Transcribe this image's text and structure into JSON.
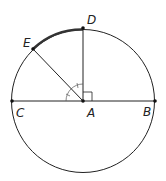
{
  "diagram": {
    "type": "circle-geometry",
    "center": {
      "label": "A",
      "x": 83,
      "y": 101
    },
    "radius": 71,
    "points": [
      {
        "label": "A",
        "x": 83,
        "y": 101,
        "label_x": 87,
        "label_y": 117
      },
      {
        "label": "B",
        "x": 155,
        "y": 101,
        "label_x": 143,
        "label_y": 116
      },
      {
        "label": "C",
        "x": 12,
        "y": 101,
        "label_x": 16,
        "label_y": 117
      },
      {
        "label": "D",
        "x": 83,
        "y": 27,
        "label_x": 87,
        "label_y": 24
      },
      {
        "label": "E",
        "x": 33,
        "y": 49,
        "label_x": 23,
        "label_y": 47
      }
    ],
    "segments": [
      "CB",
      "AD",
      "AE"
    ],
    "highlighted_arc": "ED",
    "marks": {
      "right_angle": "DAB",
      "congruent_angles": [
        "CAE",
        "EAD"
      ]
    },
    "colors": {
      "stroke": "#222222",
      "arc_highlight": "#333333",
      "background": "#ffffff"
    }
  }
}
